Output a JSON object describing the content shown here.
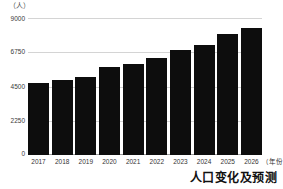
{
  "chart_data": {
    "type": "bar",
    "title": "人口变化及预测",
    "xlabel": "（年份）",
    "ylabel": "（人）",
    "categories": [
      "2017",
      "2018",
      "2019",
      "2020",
      "2021",
      "2022",
      "2023",
      "2024",
      "2025",
      "2026"
    ],
    "values": [
      4700,
      4900,
      5150,
      5750,
      6000,
      6400,
      6900,
      7200,
      7950,
      8350
    ],
    "ylim": [
      0,
      9000
    ],
    "yticks": [
      0,
      2250,
      4500,
      6750,
      9000
    ],
    "ytick_labels": [
      "0",
      "2250",
      "4500",
      "6750",
      "9000"
    ],
    "grid": true,
    "legend": null,
    "bar_color": "#0d0d0d",
    "grid_color": "#d4d4d4",
    "axis_color": "#9a9a9a",
    "series": [
      {
        "name": "人口",
        "values": [
          4700,
          4900,
          5150,
          5750,
          6000,
          6400,
          6900,
          7200,
          7950,
          8350
        ]
      }
    ]
  }
}
